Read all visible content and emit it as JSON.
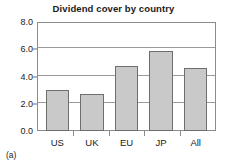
{
  "figure": {
    "subfigure_label": "(a)"
  },
  "chart_data": {
    "type": "bar",
    "title": "Dividend cover by country",
    "xlabel": "",
    "ylabel": "",
    "categories": [
      "US",
      "UK",
      "EU",
      "JP",
      "All"
    ],
    "values": [
      3.0,
      2.7,
      4.75,
      5.9,
      4.65
    ],
    "ylim": [
      0.0,
      8.0
    ],
    "ytick_values": [
      0.0,
      2.0,
      4.0,
      6.0,
      8.0
    ],
    "ytick_labels": [
      "0.0",
      "2.0",
      "4.0",
      "6.0",
      "8.0"
    ],
    "grid": true,
    "grid_axis": "y",
    "legend": false,
    "bar_fill_color": "#c9c9c9",
    "bar_border_color": "#6e6e6e",
    "gridline_color": "#9a9a9a",
    "axis_color": "#8c8c8c",
    "text_color": "#1a1a1a",
    "background_color": "#ffffff"
  }
}
